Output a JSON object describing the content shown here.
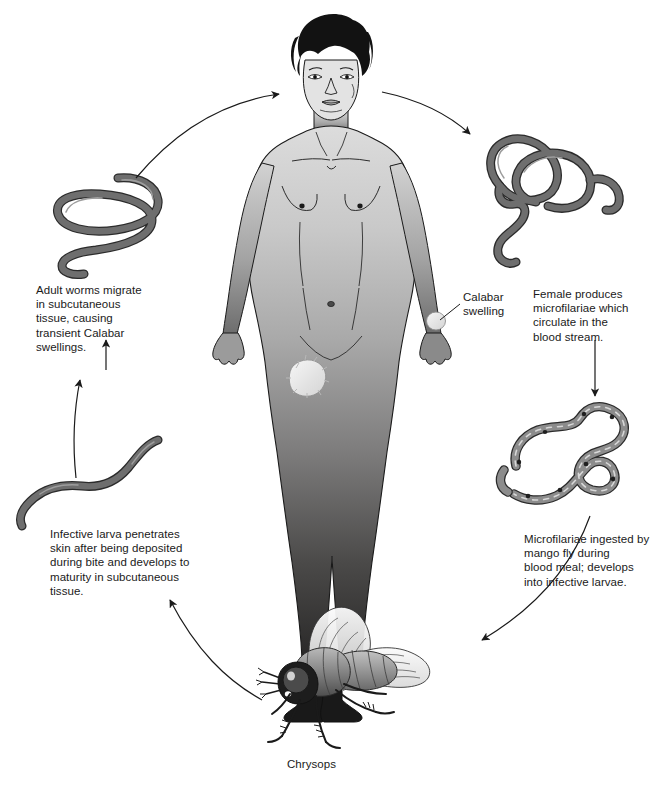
{
  "diagram": {
    "background": "#ffffff",
    "line_color": "#1a1a1a",
    "worm_fill": "#6e6e6e",
    "worm_stroke": "#2b2b2b",
    "body_light": "#d7d7d7",
    "body_dark": "#201f1f",
    "swelling_fill": "#efefef"
  },
  "labels": {
    "adult_worms": "Adult worms migrate\nin subcutaneous\ntissue, causing\ntransient Calabar\nswellings.",
    "female_produces": "Female produces\nmicrofilariae which\ncirculate in the\nblood stream.",
    "microfilariae_ingested": "Microfilariae ingested by\nmango fly during\nblood meal; develops\ninto infective larvae.",
    "infective_larva": "Infective larva penetrates\nskin after being deposited\nduring bite and develops to\nmaturity in subcutaneous\ntissue.",
    "calabar_swelling": "Calabar\nswelling",
    "fly_caption": "Chrysops"
  },
  "figures": {
    "human": "human-figure",
    "adult_worm": "adult-worm",
    "female_worms": "female-worms",
    "microfilariae": "microfilariae",
    "infective_larva": "infective-larva",
    "mango_fly": "chrysops-fly"
  },
  "arrows": [
    {
      "name": "arrow-worm-to-human",
      "direction": "up-right"
    },
    {
      "name": "arrow-human-to-female",
      "direction": "up-right"
    },
    {
      "name": "arrow-female-to-microfilariae",
      "direction": "down"
    },
    {
      "name": "arrow-microfilariae-to-fly",
      "direction": "down-left"
    },
    {
      "name": "arrow-fly-to-larva",
      "direction": "up-left"
    },
    {
      "name": "arrow-larva-to-adult",
      "direction": "up"
    }
  ]
}
